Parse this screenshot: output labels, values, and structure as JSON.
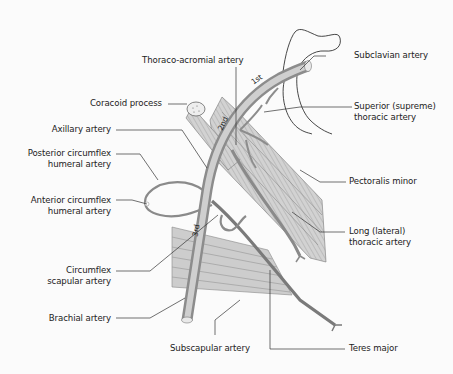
{
  "figure": {
    "colors": {
      "background": "#fbfbfb",
      "artery_fill": "#bdbdbd",
      "artery_dark": "#8a8a8a",
      "muscle_fill": "#c9c9c9",
      "line": "#333333",
      "text": "#222222"
    },
    "segment_markers": [
      "1st",
      "2nd",
      "3rd"
    ],
    "labels_left": [
      {
        "id": "coracoid",
        "text": "Coracoid process"
      },
      {
        "id": "axillary",
        "text": "Axillary artery"
      },
      {
        "id": "post_circ_1",
        "text": "Posterior circumflex"
      },
      {
        "id": "post_circ_2",
        "text": "humeral artery"
      },
      {
        "id": "ant_circ_1",
        "text": "Anterior circumflex"
      },
      {
        "id": "ant_circ_2",
        "text": "humeral artery"
      },
      {
        "id": "circ_scap_1",
        "text": "Circumflex"
      },
      {
        "id": "circ_scap_2",
        "text": "scapular artery"
      },
      {
        "id": "brachial",
        "text": "Brachial artery"
      }
    ],
    "labels_top": [
      {
        "id": "thoraco",
        "text": "Thoraco-acromial artery"
      }
    ],
    "labels_right": [
      {
        "id": "subclavian",
        "text": "Subclavian artery"
      },
      {
        "id": "superior_1",
        "text": "Superior (supreme)"
      },
      {
        "id": "superior_2",
        "text": "thoracic artery"
      },
      {
        "id": "pect_minor",
        "text": "Pectoralis minor"
      },
      {
        "id": "long_1",
        "text": "Long (lateral)"
      },
      {
        "id": "long_2",
        "text": "thoracic artery"
      },
      {
        "id": "teres",
        "text": "Teres major"
      }
    ],
    "labels_bottom": [
      {
        "id": "subscapular",
        "text": "Subscapular artery"
      }
    ]
  }
}
